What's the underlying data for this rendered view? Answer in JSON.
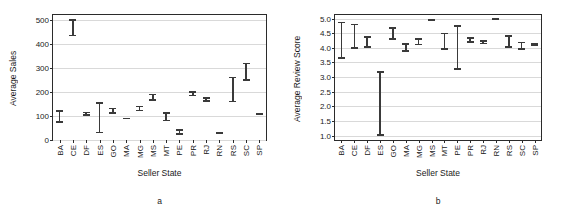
{
  "figure": {
    "panels": [
      {
        "id": "a",
        "caption": "a",
        "chart_data": {
          "type": "errorbar",
          "title": "",
          "xlabel": "Seller State",
          "ylabel": "Average Sales",
          "ylim": [
            0,
            520
          ],
          "yticks": [
            0,
            100,
            200,
            300,
            400,
            500
          ],
          "ytick_labels": [
            "0",
            "100",
            "200",
            "300",
            "400",
            "500"
          ],
          "grid": true,
          "legend": "none",
          "categories": [
            "BA",
            "CE",
            "DF",
            "ES",
            "GO",
            "MA",
            "MG",
            "MS",
            "MT",
            "PE",
            "PR",
            "RJ",
            "RN",
            "RS",
            "SC",
            "SP"
          ],
          "series": [
            {
              "name": "Average Sales",
              "lower": [
                72,
                432,
                100,
                28,
                110,
                87,
                120,
                163,
                78,
                22,
                182,
                158,
                28,
                157,
                247,
                105
              ],
              "upper": [
                124,
                503,
                117,
                158,
                135,
                92,
                143,
                193,
                115,
                45,
                203,
                177,
                32,
                263,
                322,
                112
              ],
              "mean": [
                98,
                468,
                108,
                93,
                122,
                89,
                131,
                178,
                96,
                33,
                192,
                167,
                30,
                210,
                285,
                108
              ]
            }
          ]
        }
      },
      {
        "id": "b",
        "caption": "b",
        "chart_data": {
          "type": "errorbar",
          "title": "",
          "xlabel": "Seller State",
          "ylabel": "Average Review Score",
          "ylim": [
            0.85,
            5.12
          ],
          "yticks": [
            1.0,
            1.5,
            2.0,
            2.5,
            3.0,
            3.5,
            4.0,
            4.5,
            5.0
          ],
          "ytick_labels": [
            "1.0",
            "1.5",
            "2.0",
            "2.5",
            "3.0",
            "3.5",
            "4.0",
            "4.5",
            "5.0"
          ],
          "grid": true,
          "legend": "none",
          "categories": [
            "BA",
            "CE",
            "DF",
            "ES",
            "GO",
            "MA",
            "MG",
            "MS",
            "MT",
            "PE",
            "PR",
            "RJ",
            "RN",
            "RS",
            "SC",
            "SP"
          ],
          "series": [
            {
              "name": "Average Review Score",
              "lower": [
                3.63,
                3.96,
                4.0,
                1.0,
                4.28,
                3.87,
                4.09,
                4.92,
                3.93,
                3.25,
                4.18,
                4.12,
                5.0,
                4.0,
                3.93,
                4.06
              ],
              "upper": [
                4.89,
                4.82,
                4.4,
                3.2,
                4.7,
                4.16,
                4.33,
                4.99,
                4.52,
                4.78,
                4.37,
                4.26,
                5.01,
                4.43,
                4.21,
                4.15
              ],
              "mean": [
                4.26,
                4.39,
                4.2,
                2.1,
                4.49,
                4.01,
                4.21,
                4.95,
                4.22,
                4.01,
                4.27,
                4.19,
                5.0,
                4.21,
                4.07,
                4.1
              ]
            }
          ]
        }
      }
    ]
  }
}
